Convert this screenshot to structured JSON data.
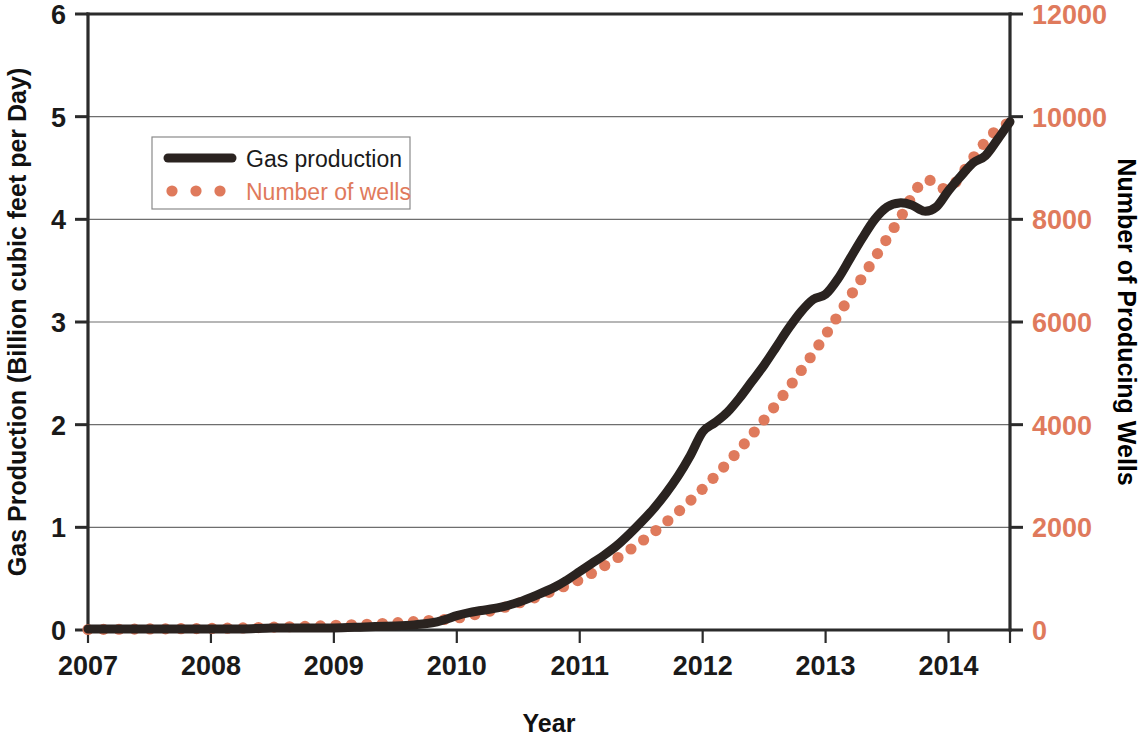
{
  "chart_data": {
    "type": "line",
    "title": "",
    "xlabel": "Year",
    "ylabel": "Gas Production (Billion cubic feet per Day)",
    "y2label": "Number of Producing Wells",
    "xlim": [
      2007,
      2014.5
    ],
    "ylim": [
      0,
      6
    ],
    "y2lim": [
      0,
      12000
    ],
    "xticks": [
      2007,
      2008,
      2009,
      2010,
      2011,
      2012,
      2013,
      2014
    ],
    "xtick_labels": [
      "2007",
      "2008",
      "2009",
      "2010",
      "2011",
      "2012",
      "2013",
      "2014"
    ],
    "yticks": [
      0,
      1,
      2,
      3,
      4,
      5,
      6
    ],
    "ytick_labels": [
      "0",
      "1",
      "2",
      "3",
      "4",
      "5",
      "6"
    ],
    "y2ticks": [
      0,
      2000,
      4000,
      6000,
      8000,
      10000,
      12000
    ],
    "y2tick_labels": [
      "0",
      "2000",
      "4000",
      "6000",
      "8000",
      "10000",
      "12000"
    ],
    "grid": "horizontal",
    "legend_position": "upper-left",
    "colors": {
      "gas_production": "#2a2320",
      "number_of_wells": "#df7a5c",
      "axis": "#2b2b2b",
      "gridline": "#6e6e6e",
      "background": "#ffffff"
    },
    "series": [
      {
        "name": "Gas production",
        "style": "solid",
        "axis": "left",
        "color": "#2a2320",
        "x": [
          2007.0,
          2007.25,
          2007.5,
          2007.75,
          2008.0,
          2008.25,
          2008.5,
          2008.75,
          2009.0,
          2009.25,
          2009.5,
          2009.65,
          2009.8,
          2009.9,
          2010.0,
          2010.1,
          2010.2,
          2010.35,
          2010.5,
          2010.65,
          2010.8,
          2010.9,
          2011.0,
          2011.1,
          2011.2,
          2011.3,
          2011.4,
          2011.5,
          2011.6,
          2011.7,
          2011.8,
          2011.9,
          2012.0,
          2012.1,
          2012.2,
          2012.3,
          2012.4,
          2012.5,
          2012.6,
          2012.7,
          2012.8,
          2012.9,
          2013.0,
          2013.1,
          2013.2,
          2013.3,
          2013.4,
          2013.5,
          2013.6,
          2013.7,
          2013.8,
          2013.9,
          2014.0,
          2014.1,
          2014.2,
          2014.3,
          2014.4,
          2014.5
        ],
        "y": [
          0.01,
          0.01,
          0.01,
          0.01,
          0.01,
          0.01,
          0.02,
          0.02,
          0.02,
          0.03,
          0.04,
          0.05,
          0.07,
          0.1,
          0.14,
          0.17,
          0.19,
          0.22,
          0.27,
          0.34,
          0.42,
          0.49,
          0.57,
          0.65,
          0.73,
          0.82,
          0.93,
          1.05,
          1.18,
          1.33,
          1.5,
          1.7,
          1.93,
          2.02,
          2.12,
          2.26,
          2.42,
          2.58,
          2.76,
          2.94,
          3.1,
          3.22,
          3.27,
          3.42,
          3.62,
          3.82,
          4.0,
          4.12,
          4.16,
          4.14,
          4.08,
          4.12,
          4.28,
          4.42,
          4.55,
          4.62,
          4.78,
          4.95
        ]
      },
      {
        "name": "Number of  wells",
        "style": "dotted",
        "axis": "right",
        "color": "#df7a5c",
        "x": [
          2007.0,
          2007.25,
          2007.5,
          2007.75,
          2008.0,
          2008.25,
          2008.5,
          2008.75,
          2009.0,
          2009.25,
          2009.5,
          2009.75,
          2010.0,
          2010.2,
          2010.4,
          2010.6,
          2010.8,
          2011.0,
          2011.2,
          2011.4,
          2011.6,
          2011.8,
          2012.0,
          2012.2,
          2012.4,
          2012.6,
          2012.8,
          2013.0,
          2013.2,
          2013.4,
          2013.6,
          2013.8,
          2014.0,
          2014.2,
          2014.35,
          2014.5
        ],
        "y": [
          10,
          15,
          20,
          25,
          30,
          40,
          55,
          70,
          90,
          110,
          140,
          180,
          230,
          330,
          450,
          600,
          780,
          980,
          1250,
          1550,
          1900,
          2300,
          2750,
          3250,
          3800,
          4400,
          5050,
          5750,
          6500,
          7250,
          8000,
          8750,
          8600,
          9200,
          9650,
          9900
        ]
      }
    ]
  },
  "legend": {
    "entries": [
      {
        "label": "Gas production",
        "marker": "solid-line",
        "color": "#2a2320"
      },
      {
        "label": "Number of  wells",
        "marker": "dotted-line",
        "color": "#df7a5c"
      }
    ]
  }
}
